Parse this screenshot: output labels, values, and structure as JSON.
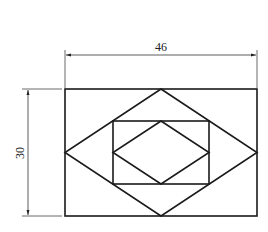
{
  "figure": {
    "type": "technical-drawing",
    "stroke_color": "#1a1a1a",
    "dimension_color": "#333333"
  },
  "dimensions": {
    "width": {
      "label": "46",
      "value": 46
    },
    "height": {
      "label": "30",
      "value": 30
    }
  },
  "shapes": {
    "outer_rectangle": {
      "x": 65,
      "y": 89,
      "w": 192,
      "h": 127
    },
    "outer_rhombus": {
      "points": "161,89 257,152.5 161,216 65,152.5"
    },
    "inner_rectangle": {
      "x": 113,
      "y": 121,
      "w": 96,
      "h": 63
    },
    "inner_rhombus": {
      "points": "161,121 209,152.5 161,184 113,152.5"
    }
  }
}
